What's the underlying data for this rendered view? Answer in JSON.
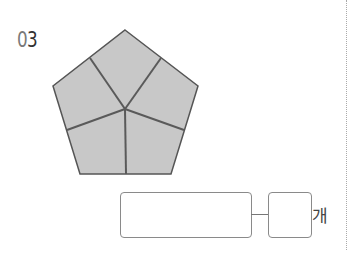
{
  "problem": {
    "number_digit_1": "0",
    "number_digit_2": "3"
  },
  "figure": {
    "shape": "regular pentagon divided into 5 congruent pieces",
    "fill_color": "#c8c8c8",
    "line_color": "#555555"
  },
  "answer": {
    "expression_box_value": "",
    "count_box_value": "",
    "unit": "개"
  }
}
